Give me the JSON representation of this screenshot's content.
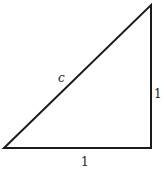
{
  "diagram": {
    "type": "right-triangle",
    "vertices": {
      "bottom_left": [
        4,
        148
      ],
      "bottom_right": [
        151,
        148
      ],
      "top_right": [
        151,
        5
      ]
    },
    "stroke_color": "#1a1a1a",
    "stroke_width": 2,
    "labels": {
      "hypotenuse": "c",
      "vertical_leg": "1",
      "horizontal_leg": "1"
    }
  }
}
